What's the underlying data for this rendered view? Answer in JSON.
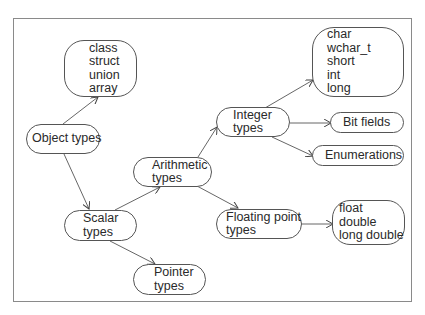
{
  "diagram": {
    "nodes": {
      "aggregate": {
        "lines": [
          "class",
          "struct",
          "union",
          "array"
        ]
      },
      "object": {
        "lines": [
          "Object types"
        ]
      },
      "scalar": {
        "lines": [
          "Scalar",
          "types"
        ]
      },
      "arithmetic": {
        "lines": [
          "Arithmetic",
          "types"
        ]
      },
      "integer": {
        "lines": [
          "Integer",
          "types"
        ]
      },
      "integer_kinds": {
        "lines": [
          "char",
          "wchar_t",
          "short",
          "int",
          "long"
        ]
      },
      "bitfields": {
        "lines": [
          "Bit fields"
        ]
      },
      "enumerations": {
        "lines": [
          "Enumerations"
        ]
      },
      "floating": {
        "lines": [
          "Floating point",
          "types"
        ]
      },
      "float_kinds": {
        "lines": [
          "float",
          "double",
          "long double"
        ]
      },
      "pointer": {
        "lines": [
          "Pointer",
          "types"
        ]
      }
    },
    "edges": [
      {
        "from": "Object types",
        "to": "class/struct/union/array"
      },
      {
        "from": "Object types",
        "to": "Scalar types"
      },
      {
        "from": "Scalar types",
        "to": "Arithmetic types"
      },
      {
        "from": "Scalar types",
        "to": "Pointer types"
      },
      {
        "from": "Arithmetic types",
        "to": "Integer types"
      },
      {
        "from": "Arithmetic types",
        "to": "Floating point types"
      },
      {
        "from": "Integer types",
        "to": "char/wchar_t/short/int/long"
      },
      {
        "from": "Integer types",
        "to": "Bit fields"
      },
      {
        "from": "Integer types",
        "to": "Enumerations"
      },
      {
        "from": "Floating point types",
        "to": "float/double/long double"
      }
    ],
    "colors": {
      "line": "#555555",
      "frame": "#8a8a8a",
      "text": "#2a2a2a"
    }
  }
}
